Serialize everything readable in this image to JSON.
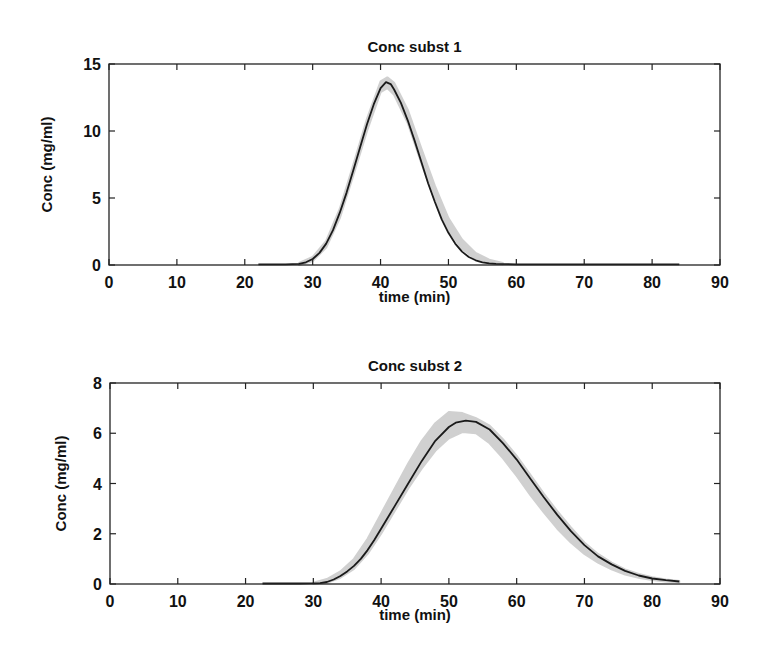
{
  "chart_data": [
    {
      "type": "line",
      "title": "Conc subst 1",
      "xlabel": "time (min)",
      "ylabel": "Conc (mg/ml)",
      "xlim": [
        0,
        90
      ],
      "ylim": [
        0,
        15
      ],
      "xticks": [
        0,
        10,
        20,
        30,
        40,
        50,
        60,
        70,
        80,
        90
      ],
      "yticks": [
        0,
        5,
        10,
        15
      ],
      "grid": false,
      "legend": null,
      "series": [
        {
          "name": "mean",
          "x": [
            22,
            26,
            28,
            29,
            30,
            31,
            32,
            33,
            34,
            35,
            36,
            37,
            38,
            39,
            40,
            40.8,
            41.5,
            42,
            43,
            44,
            45,
            46,
            47,
            48,
            49,
            50,
            51,
            52,
            53,
            54,
            55,
            56,
            57,
            60,
            70,
            84
          ],
          "y": [
            0.05,
            0.05,
            0.08,
            0.2,
            0.45,
            0.9,
            1.6,
            2.6,
            3.9,
            5.4,
            7.1,
            8.8,
            10.5,
            12.0,
            13.2,
            13.65,
            13.5,
            13.1,
            12.1,
            10.8,
            9.3,
            7.7,
            6.1,
            4.7,
            3.4,
            2.4,
            1.6,
            1.0,
            0.6,
            0.35,
            0.2,
            0.12,
            0.08,
            0.05,
            0.05,
            0.05
          ]
        }
      ],
      "band": {
        "name": "variability envelope",
        "x": [
          28,
          30,
          32,
          34,
          36,
          38,
          40,
          41,
          42,
          44,
          46,
          48,
          50,
          52,
          54,
          56,
          58
        ],
        "lower": [
          0,
          0.3,
          1.3,
          3.5,
          6.7,
          10.0,
          12.9,
          13.2,
          12.7,
          10.6,
          7.6,
          4.8,
          2.6,
          1.2,
          0.45,
          0.15,
          0.05
        ],
        "upper": [
          0.15,
          0.6,
          1.8,
          4.2,
          7.5,
          10.9,
          13.7,
          14.0,
          13.6,
          11.6,
          8.7,
          5.9,
          3.5,
          1.9,
          0.9,
          0.4,
          0.15
        ]
      }
    },
    {
      "type": "line",
      "title": "Conc subst 2",
      "xlabel": "time (min)",
      "ylabel": "Conc (mg/ml)",
      "xlim": [
        0,
        90
      ],
      "ylim": [
        0,
        8
      ],
      "xticks": [
        0,
        10,
        20,
        30,
        40,
        50,
        60,
        70,
        80,
        90
      ],
      "yticks": [
        0,
        2,
        4,
        6,
        8
      ],
      "grid": false,
      "legend": null,
      "series": [
        {
          "name": "mean",
          "x": [
            22.5,
            28,
            31,
            32,
            33,
            34,
            35,
            36,
            37,
            38,
            39,
            40,
            42,
            44,
            46,
            48,
            50,
            51,
            52.5,
            54,
            56,
            58,
            60,
            62,
            64,
            66,
            68,
            70,
            72,
            74,
            76,
            78,
            80,
            82,
            84
          ],
          "y": [
            0.02,
            0.02,
            0.03,
            0.08,
            0.18,
            0.32,
            0.5,
            0.72,
            1.0,
            1.35,
            1.75,
            2.2,
            3.1,
            4.0,
            4.9,
            5.7,
            6.25,
            6.42,
            6.5,
            6.45,
            6.15,
            5.6,
            4.95,
            4.2,
            3.45,
            2.75,
            2.1,
            1.55,
            1.1,
            0.78,
            0.52,
            0.34,
            0.22,
            0.15,
            0.1
          ]
        }
      ],
      "band": {
        "name": "variability envelope",
        "x": [
          30,
          32,
          34,
          36,
          38,
          40,
          42,
          44,
          46,
          48,
          50,
          52,
          54,
          56,
          58,
          60,
          62,
          64,
          66,
          68,
          70,
          72,
          74,
          76,
          78,
          80,
          82,
          84
        ],
        "lower": [
          0,
          0.05,
          0.25,
          0.6,
          1.2,
          2.0,
          2.9,
          3.8,
          4.6,
          5.3,
          5.8,
          6.05,
          6.0,
          5.6,
          5.0,
          4.3,
          3.55,
          2.85,
          2.2,
          1.65,
          1.2,
          0.85,
          0.58,
          0.38,
          0.25,
          0.16,
          0.1,
          0.07
        ],
        "upper": [
          0.05,
          0.2,
          0.5,
          1.0,
          1.8,
          2.8,
          3.8,
          4.8,
          5.7,
          6.4,
          6.85,
          6.8,
          6.6,
          6.3,
          5.75,
          5.1,
          4.35,
          3.6,
          2.9,
          2.25,
          1.65,
          1.2,
          0.85,
          0.58,
          0.4,
          0.27,
          0.18,
          0.12
        ]
      }
    }
  ],
  "style": {
    "line_color": "#1a1a1a",
    "band_color": "#c8c8c8",
    "axis_color": "#222222",
    "background": "#ffffff"
  }
}
